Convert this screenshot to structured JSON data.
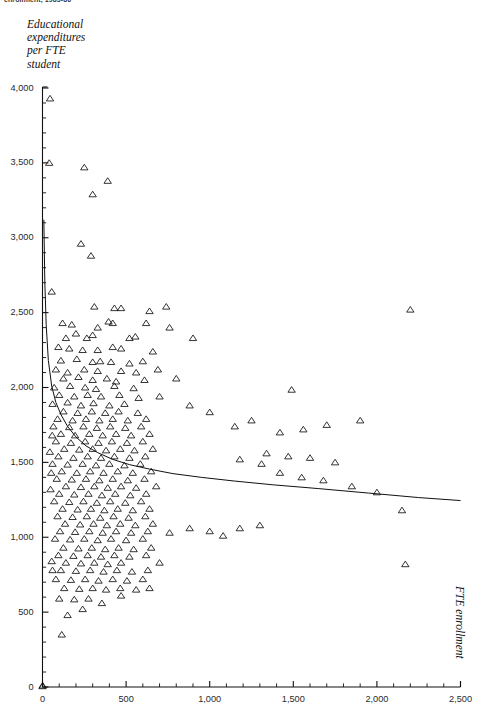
{
  "page": {
    "clipped_header": "enrollment, 1985-86"
  },
  "axes": {
    "y_title": "Educational\nexpenditures\nper FTE\nstudent",
    "x_title": "FTE enrollment",
    "y_ticks": [
      "0",
      "500",
      "1,000",
      "1,500",
      "2,000",
      "2,500",
      "3,000",
      "3,500",
      "4,000"
    ],
    "x_ticks": [
      "0",
      "500",
      "1,000",
      "1,500",
      "2,000",
      "2,500"
    ]
  },
  "chart_data": {
    "type": "scatter",
    "title": "enrollment, 1985-86",
    "xlabel": "FTE enrollment",
    "ylabel": "Educational expenditures per FTE student",
    "xlim": [
      0,
      2500
    ],
    "ylim": [
      0,
      4000
    ],
    "xticks": [
      0,
      500,
      1000,
      1500,
      2000,
      2500
    ],
    "yticks": [
      0,
      500,
      1000,
      1500,
      2000,
      2500,
      3000,
      3500,
      4000
    ],
    "x_minor_tick_step": 100,
    "y_minor_tick_step": 100,
    "grid": false,
    "legend": null,
    "marker": "open-triangle",
    "marker_color": "#111111",
    "series": [
      {
        "name": "institutions",
        "marker": "open-triangle",
        "points": [
          [
            45,
            3930
          ],
          [
            40,
            3500
          ],
          [
            250,
            3470
          ],
          [
            300,
            3290
          ],
          [
            390,
            3380
          ],
          [
            290,
            2880
          ],
          [
            230,
            2960
          ],
          [
            55,
            2640
          ],
          [
            310,
            2540
          ],
          [
            640,
            2510
          ],
          [
            740,
            2540
          ],
          [
            2200,
            2520
          ],
          [
            430,
            2530
          ],
          [
            470,
            2530
          ],
          [
            120,
            2430
          ],
          [
            175,
            2420
          ],
          [
            330,
            2400
          ],
          [
            395,
            2440
          ],
          [
            420,
            2430
          ],
          [
            620,
            2430
          ],
          [
            760,
            2400
          ],
          [
            140,
            2330
          ],
          [
            200,
            2360
          ],
          [
            265,
            2330
          ],
          [
            300,
            2350
          ],
          [
            520,
            2330
          ],
          [
            555,
            2340
          ],
          [
            900,
            2330
          ],
          [
            95,
            2270
          ],
          [
            160,
            2260
          ],
          [
            240,
            2250
          ],
          [
            330,
            2250
          ],
          [
            420,
            2270
          ],
          [
            470,
            2260
          ],
          [
            660,
            2240
          ],
          [
            110,
            2180
          ],
          [
            205,
            2190
          ],
          [
            300,
            2170
          ],
          [
            345,
            2175
          ],
          [
            410,
            2170
          ],
          [
            520,
            2160
          ],
          [
            600,
            2175
          ],
          [
            80,
            2120
          ],
          [
            150,
            2100
          ],
          [
            250,
            2120
          ],
          [
            330,
            2110
          ],
          [
            470,
            2110
          ],
          [
            560,
            2100
          ],
          [
            690,
            2120
          ],
          [
            125,
            2060
          ],
          [
            215,
            2070
          ],
          [
            300,
            2050
          ],
          [
            385,
            2060
          ],
          [
            440,
            2040
          ],
          [
            610,
            2050
          ],
          [
            800,
            2060
          ],
          [
            70,
            2000
          ],
          [
            165,
            2010
          ],
          [
            255,
            2000
          ],
          [
            320,
            1990
          ],
          [
            430,
            2010
          ],
          [
            545,
            1995
          ],
          [
            1490,
            1985
          ],
          [
            100,
            1950
          ],
          [
            190,
            1940
          ],
          [
            270,
            1950
          ],
          [
            350,
            1940
          ],
          [
            460,
            1950
          ],
          [
            575,
            1930
          ],
          [
            700,
            1940
          ],
          [
            60,
            1890
          ],
          [
            150,
            1900
          ],
          [
            230,
            1880
          ],
          [
            305,
            1895
          ],
          [
            400,
            1880
          ],
          [
            490,
            1890
          ],
          [
            880,
            1880
          ],
          [
            125,
            1840
          ],
          [
            210,
            1830
          ],
          [
            295,
            1840
          ],
          [
            375,
            1830
          ],
          [
            455,
            1840
          ],
          [
            570,
            1830
          ],
          [
            1000,
            1835
          ],
          [
            90,
            1790
          ],
          [
            180,
            1780
          ],
          [
            260,
            1790
          ],
          [
            340,
            1780
          ],
          [
            420,
            1790
          ],
          [
            510,
            1780
          ],
          [
            620,
            1790
          ],
          [
            65,
            1740
          ],
          [
            160,
            1735
          ],
          [
            245,
            1740
          ],
          [
            325,
            1730
          ],
          [
            405,
            1740
          ],
          [
            495,
            1730
          ],
          [
            590,
            1740
          ],
          [
            1250,
            1780
          ],
          [
            1700,
            1750
          ],
          [
            1900,
            1780
          ],
          [
            1560,
            1720
          ],
          [
            1420,
            1700
          ],
          [
            1150,
            1740
          ],
          [
            110,
            1690
          ],
          [
            195,
            1680
          ],
          [
            280,
            1690
          ],
          [
            360,
            1680
          ],
          [
            440,
            1690
          ],
          [
            530,
            1680
          ],
          [
            640,
            1690
          ],
          [
            80,
            1640
          ],
          [
            170,
            1630
          ],
          [
            255,
            1640
          ],
          [
            335,
            1630
          ],
          [
            415,
            1640
          ],
          [
            505,
            1630
          ],
          [
            600,
            1640
          ],
          [
            130,
            1590
          ],
          [
            220,
            1585
          ],
          [
            300,
            1590
          ],
          [
            380,
            1580
          ],
          [
            465,
            1590
          ],
          [
            550,
            1580
          ],
          [
            660,
            1590
          ],
          [
            95,
            1540
          ],
          [
            185,
            1530
          ],
          [
            270,
            1540
          ],
          [
            350,
            1530
          ],
          [
            430,
            1540
          ],
          [
            520,
            1530
          ],
          [
            615,
            1540
          ],
          [
            1340,
            1560
          ],
          [
            1470,
            1540
          ],
          [
            1600,
            1530
          ],
          [
            1750,
            1500
          ],
          [
            1310,
            1490
          ],
          [
            1180,
            1520
          ],
          [
            60,
            1490
          ],
          [
            150,
            1485
          ],
          [
            240,
            1490
          ],
          [
            320,
            1480
          ],
          [
            400,
            1490
          ],
          [
            490,
            1480
          ],
          [
            585,
            1490
          ],
          [
            115,
            1440
          ],
          [
            205,
            1430
          ],
          [
            285,
            1440
          ],
          [
            365,
            1430
          ],
          [
            450,
            1440
          ],
          [
            540,
            1430
          ],
          [
            650,
            1440
          ],
          [
            85,
            1390
          ],
          [
            175,
            1385
          ],
          [
            260,
            1390
          ],
          [
            340,
            1380
          ],
          [
            420,
            1390
          ],
          [
            510,
            1380
          ],
          [
            610,
            1390
          ],
          [
            140,
            1340
          ],
          [
            230,
            1335
          ],
          [
            310,
            1340
          ],
          [
            390,
            1330
          ],
          [
            470,
            1340
          ],
          [
            560,
            1330
          ],
          [
            680,
            1340
          ],
          [
            100,
            1290
          ],
          [
            190,
            1285
          ],
          [
            275,
            1290
          ],
          [
            355,
            1280
          ],
          [
            435,
            1290
          ],
          [
            525,
            1280
          ],
          [
            620,
            1290
          ],
          [
            1420,
            1430
          ],
          [
            1550,
            1400
          ],
          [
            1680,
            1380
          ],
          [
            1850,
            1340
          ],
          [
            2000,
            1300
          ],
          [
            2150,
            1180
          ],
          [
            70,
            1240
          ],
          [
            160,
            1235
          ],
          [
            245,
            1240
          ],
          [
            325,
            1230
          ],
          [
            405,
            1240
          ],
          [
            495,
            1230
          ],
          [
            590,
            1240
          ],
          [
            120,
            1190
          ],
          [
            210,
            1185
          ],
          [
            290,
            1190
          ],
          [
            370,
            1180
          ],
          [
            450,
            1190
          ],
          [
            540,
            1180
          ],
          [
            640,
            1190
          ],
          [
            90,
            1140
          ],
          [
            180,
            1135
          ],
          [
            265,
            1140
          ],
          [
            345,
            1130
          ],
          [
            425,
            1140
          ],
          [
            515,
            1130
          ],
          [
            615,
            1140
          ],
          [
            135,
            1090
          ],
          [
            225,
            1085
          ],
          [
            305,
            1090
          ],
          [
            385,
            1080
          ],
          [
            465,
            1090
          ],
          [
            555,
            1080
          ],
          [
            660,
            1090
          ],
          [
            105,
            1040
          ],
          [
            195,
            1035
          ],
          [
            280,
            1040
          ],
          [
            360,
            1030
          ],
          [
            440,
            1040
          ],
          [
            530,
            1030
          ],
          [
            630,
            1040
          ],
          [
            1180,
            1060
          ],
          [
            1300,
            1080
          ],
          [
            1000,
            1040
          ],
          [
            880,
            1060
          ],
          [
            760,
            1030
          ],
          [
            1080,
            1010
          ],
          [
            75,
            990
          ],
          [
            165,
            985
          ],
          [
            250,
            990
          ],
          [
            330,
            980
          ],
          [
            410,
            990
          ],
          [
            500,
            980
          ],
          [
            600,
            990
          ],
          [
            125,
            930
          ],
          [
            215,
            925
          ],
          [
            295,
            930
          ],
          [
            375,
            920
          ],
          [
            455,
            930
          ],
          [
            545,
            920
          ],
          [
            650,
            930
          ],
          [
            95,
            880
          ],
          [
            185,
            875
          ],
          [
            270,
            880
          ],
          [
            350,
            870
          ],
          [
            430,
            880
          ],
          [
            520,
            870
          ],
          [
            620,
            880
          ],
          [
            140,
            830
          ],
          [
            230,
            825
          ],
          [
            310,
            830
          ],
          [
            390,
            820
          ],
          [
            470,
            830
          ],
          [
            2170,
            820
          ],
          [
            700,
            830
          ],
          [
            110,
            780
          ],
          [
            200,
            775
          ],
          [
            285,
            780
          ],
          [
            365,
            770
          ],
          [
            445,
            780
          ],
          [
            535,
            770
          ],
          [
            630,
            780
          ],
          [
            80,
            720
          ],
          [
            170,
            715
          ],
          [
            255,
            720
          ],
          [
            335,
            710
          ],
          [
            420,
            720
          ],
          [
            505,
            710
          ],
          [
            600,
            720
          ],
          [
            130,
            660
          ],
          [
            220,
            655
          ],
          [
            300,
            660
          ],
          [
            380,
            650
          ],
          [
            465,
            660
          ],
          [
            560,
            650
          ],
          [
            640,
            660
          ],
          [
            100,
            590
          ],
          [
            190,
            585
          ],
          [
            275,
            590
          ],
          [
            470,
            610
          ],
          [
            355,
            560
          ],
          [
            240,
            520
          ],
          [
            150,
            480
          ],
          [
            115,
            350
          ],
          [
            60,
            780
          ],
          [
            55,
            840
          ],
          [
            48,
            1320
          ],
          [
            52,
            1430
          ],
          [
            44,
            1570
          ],
          [
            58,
            1680
          ],
          [
            1,
            10
          ],
          [
            0,
            5
          ]
        ]
      }
    ],
    "fit_curve": {
      "name": "fitted-regression-curve",
      "description": "decaying curve fitted through scatter",
      "points": [
        [
          8,
          3120
        ],
        [
          14,
          2700
        ],
        [
          22,
          2420
        ],
        [
          35,
          2180
        ],
        [
          55,
          2010
        ],
        [
          80,
          1900
        ],
        [
          110,
          1820
        ],
        [
          150,
          1740
        ],
        [
          200,
          1670
        ],
        [
          260,
          1610
        ],
        [
          330,
          1565
        ],
        [
          420,
          1520
        ],
        [
          520,
          1485
        ],
        [
          640,
          1455
        ],
        [
          780,
          1425
        ],
        [
          950,
          1400
        ],
        [
          1150,
          1375
        ],
        [
          1380,
          1350
        ],
        [
          1650,
          1325
        ],
        [
          1950,
          1295
        ],
        [
          2250,
          1265
        ],
        [
          2500,
          1245
        ]
      ]
    }
  }
}
